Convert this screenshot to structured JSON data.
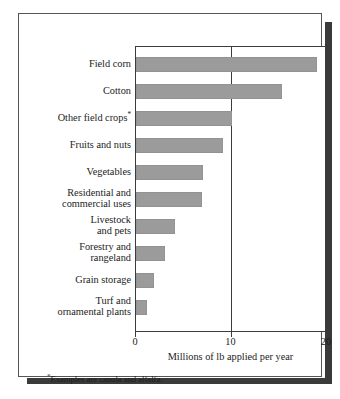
{
  "chart_data": {
    "type": "bar",
    "orientation": "horizontal",
    "title": "",
    "subtitle": "",
    "xlabel": "Millions of lb applied per year",
    "ylabel": "",
    "xlim": [
      0,
      20
    ],
    "ylim": null,
    "grid": "single vertical gridline at x=10",
    "legend": null,
    "legend_position": "none",
    "xticks": [
      "0",
      "10",
      "20"
    ],
    "xtick_values": [
      0,
      10,
      20
    ],
    "categories": [
      "Field corn",
      "Cotton",
      "Other field crops*",
      "Fruits and nuts",
      "Vegetables",
      "Residential and\ncommercial uses",
      "Livestock\nand pets",
      "Forestry and\nrangeland",
      "Grain storage",
      "Turf and\nornamental plants"
    ],
    "values": [
      19.0,
      15.3,
      10.0,
      9.1,
      7.0,
      6.9,
      4.1,
      3.0,
      1.9,
      1.1
    ],
    "bar_color": "#9b9b9b",
    "annotations": [
      {
        "marker": "*",
        "text": "Examples are canola and alfalfa."
      }
    ]
  },
  "figure": {
    "footnote_marker": "*",
    "footnote_text": "Examples are canola and alfalfa.",
    "frame_color": "#555555",
    "shadow_color": "#3a3a3a",
    "axis_color": "#3c3c3c",
    "background": "#ffffff"
  }
}
